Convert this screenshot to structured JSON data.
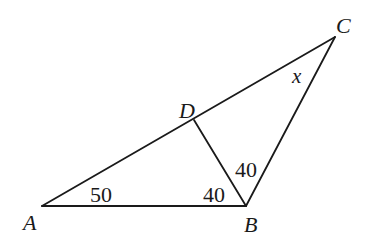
{
  "diagram": {
    "type": "geometry-triangle",
    "stroke_color": "#1a1a1a",
    "points": {
      "A": {
        "label": "A",
        "x": 42,
        "y": 206
      },
      "B": {
        "label": "B",
        "x": 246,
        "y": 206
      },
      "C": {
        "label": "C",
        "x": 335,
        "y": 37
      },
      "D": {
        "label": "D",
        "x": 194,
        "y": 120
      }
    },
    "segments": [
      {
        "from": "A",
        "to": "B"
      },
      {
        "from": "A",
        "to": "C"
      },
      {
        "from": "B",
        "to": "C"
      },
      {
        "from": "D",
        "to": "B"
      }
    ],
    "angles": {
      "angle_A": {
        "at": "A",
        "value": "50"
      },
      "angle_ABD": {
        "at": "B",
        "between": [
          "A",
          "D"
        ],
        "value": "40"
      },
      "angle_DBC": {
        "at": "B",
        "between": [
          "D",
          "C"
        ],
        "value": "40"
      },
      "angle_C": {
        "at": "C",
        "value": "x"
      }
    }
  }
}
